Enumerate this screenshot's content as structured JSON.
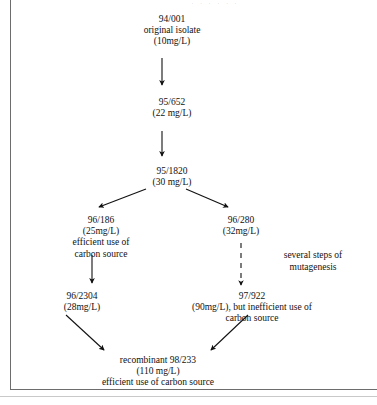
{
  "figure": {
    "type": "flowchart",
    "scan_artifact_text": "· · · ·  · ·",
    "nodes": [
      {
        "id": "94/001",
        "strain": "94/001",
        "description": "original isolate",
        "titer": "(10mg/L)",
        "text": "94/001\noriginal isolate\n(10mg/L)"
      },
      {
        "id": "95/652",
        "strain": "95/652",
        "titer": "(22 mg/L)",
        "text": "95/652\n(22 mg/L)"
      },
      {
        "id": "95/1820",
        "strain": "95/1820",
        "titer": "(30 mg/L)",
        "text": "95/1820\n(30 mg/L)"
      },
      {
        "id": "96/186",
        "strain": "96/186",
        "titer": "(25mg/L)",
        "description": "efficient use of carbon source",
        "text": "96/186\n(25mg/L)\nefficient use of\ncarbon source"
      },
      {
        "id": "96/280",
        "strain": "96/280",
        "titer": "(32mg/L)",
        "text": "96/280\n(32mg/L)"
      },
      {
        "id": "96/2304",
        "strain": "96/2304",
        "titer": "(28mg/L)",
        "text": "96/2304\n(28mg/L)"
      },
      {
        "id": "97/922",
        "strain": "97/922",
        "titer": "(90mg/L)",
        "description": "but inefficient use of carbon source",
        "text": "97/922\n(90mg/L), but inefficient use of\ncarbon source"
      },
      {
        "id": "98/233",
        "strain": "recombinant 98/233",
        "titer": "(110 mg/L)",
        "description": "efficient use of carbon source",
        "text": "recombinant 98/233\n(110 mg/L)\nefficient use of carbon source"
      }
    ],
    "edge_labels": [
      {
        "id": "mutagenesis",
        "text": "several steps of\nmutagenesis",
        "style": "dashed"
      }
    ],
    "colors": {
      "ink": "#111111",
      "rule": "#6d6d6d",
      "page": "#ffffff"
    }
  }
}
